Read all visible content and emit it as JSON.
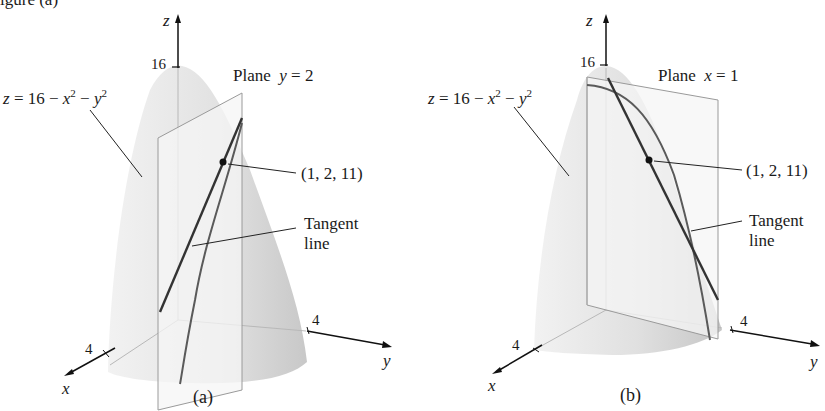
{
  "header_fragment": "igure (a)",
  "figures": [
    {
      "id": "a",
      "caption": "(a)",
      "axes": {
        "z": "z",
        "x": "x",
        "y": "y"
      },
      "ticks": {
        "z_top": "16",
        "x": "4",
        "y": "4"
      },
      "surface_label": {
        "lhs": "z",
        "eq": "= 16 −",
        "x": "x",
        "x_exp": "2",
        "minus": "−",
        "y": "y",
        "y_exp": "2"
      },
      "plane_label": {
        "word": "Plane",
        "var": "y",
        "eq": "= 2"
      },
      "point_label": "(1, 2, 11)",
      "tangent_label": {
        "line1": "Tangent",
        "line2": "line"
      }
    },
    {
      "id": "b",
      "caption": "(b)",
      "axes": {
        "z": "z",
        "x": "x",
        "y": "y"
      },
      "ticks": {
        "z_top": "16",
        "x": "4",
        "y": "4"
      },
      "surface_label": {
        "lhs": "z",
        "eq": "= 16 −",
        "x": "x",
        "x_exp": "2",
        "minus": "−",
        "y": "y",
        "y_exp": "2"
      },
      "plane_label": {
        "word": "Plane",
        "var": "x",
        "eq": "= 1"
      },
      "point_label": "(1, 2, 11)",
      "tangent_label": {
        "line1": "Tangent",
        "line2": "line"
      }
    }
  ],
  "colors": {
    "surface_light": "#ececec",
    "surface_dark": "#c9c9c9",
    "plane": "#f4f4f4",
    "curve": "#555555",
    "ink": "#1a1a1a"
  }
}
